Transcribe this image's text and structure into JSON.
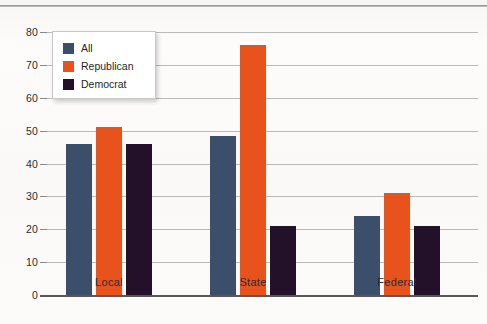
{
  "chart_data": {
    "type": "bar",
    "title": "",
    "xlabel": "",
    "ylabel": "",
    "ylim": [
      0,
      80
    ],
    "ytick_step": 10,
    "yticks": [
      "0",
      "10",
      "20",
      "30",
      "40",
      "50",
      "60",
      "70",
      "80"
    ],
    "grid": true,
    "legend_position": "top-left-inside",
    "categories": [
      "Local",
      "State",
      "Federal"
    ],
    "series": [
      {
        "name": "All",
        "color": "#3b4f6b",
        "values": [
          46,
          48.5,
          24
        ]
      },
      {
        "name": "Republican",
        "color": "#e8521c",
        "values": [
          51,
          76,
          31
        ]
      },
      {
        "name": "Democrat",
        "color": "#231029",
        "values": [
          46,
          21,
          21
        ]
      }
    ]
  },
  "legend": {
    "items": [
      {
        "label": "All"
      },
      {
        "label": "Republican"
      },
      {
        "label": "Democrat"
      }
    ]
  },
  "axis": {
    "baseline_color": "#57575a",
    "gridline_color": "#b9b9bb"
  }
}
